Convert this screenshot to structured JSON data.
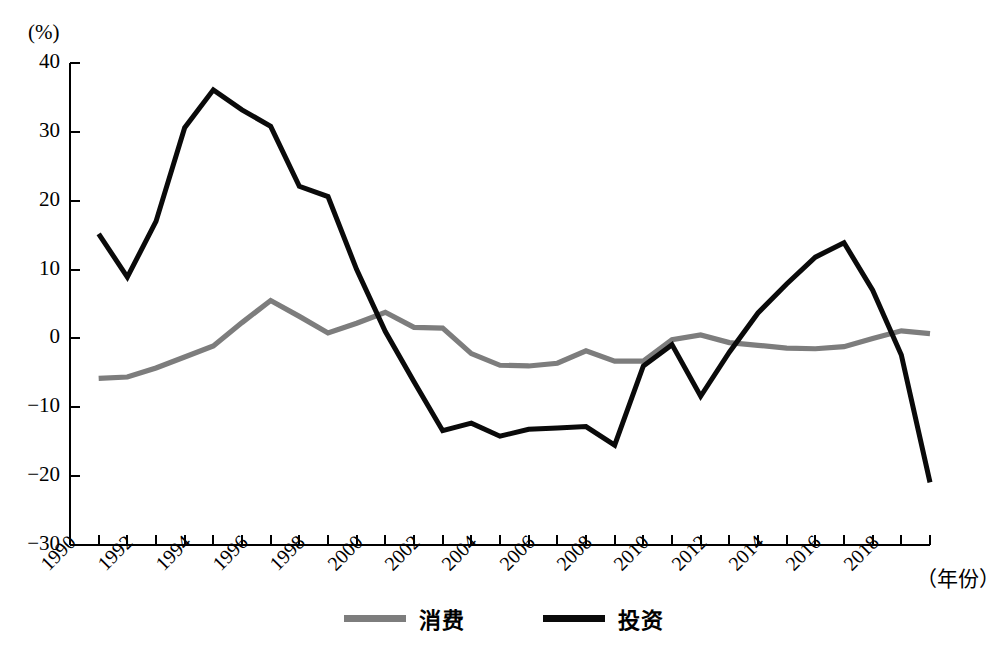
{
  "chart_data": {
    "type": "line",
    "title": "",
    "unit_label": "(%)",
    "xlabel": "（年份）",
    "ylabel": "",
    "x": [
      1991,
      1992,
      1993,
      1994,
      1995,
      1996,
      1997,
      1998,
      1999,
      2000,
      2001,
      2002,
      2003,
      2004,
      2005,
      2006,
      2007,
      2008,
      2009,
      2010,
      2011,
      2012,
      2013,
      2014,
      2015,
      2016,
      2017,
      2018,
      2019,
      2020
    ],
    "xlim": [
      1990,
      2020
    ],
    "ylim": [
      -30,
      40
    ],
    "yticks": [
      40,
      30,
      20,
      10,
      0,
      -10,
      -20,
      -30
    ],
    "ytick_labels": [
      "40",
      "30",
      "20",
      "10",
      "0",
      "−10",
      "−20",
      "−30"
    ],
    "xticks": [
      1990,
      1992,
      1994,
      1996,
      1998,
      2000,
      2002,
      2004,
      2006,
      2008,
      2010,
      2012,
      2014,
      2016,
      2018
    ],
    "xtick_labels": [
      "1990",
      "1992",
      "1994",
      "1996",
      "1998",
      "2000",
      "2002",
      "2004",
      "2006",
      "2008",
      "2010",
      "2012",
      "2014",
      "2016",
      "2018"
    ],
    "grid": false,
    "legend_position": "bottom",
    "series": [
      {
        "name": "消费",
        "color": "#7d7d7d",
        "values": [
          -5.8,
          -5.6,
          -4.3,
          -2.7,
          -1.1,
          2.3,
          5.5,
          3.2,
          0.8,
          2.2,
          3.8,
          1.6,
          1.5,
          -2.2,
          -3.9,
          -4.0,
          -3.6,
          -1.8,
          -3.3,
          -3.3,
          -0.2,
          0.5,
          -0.6,
          -1.0,
          -1.4,
          -1.5,
          -1.2,
          0.0,
          1.1,
          0.7
        ]
      },
      {
        "name": "投资",
        "color": "#0a0a0a",
        "values": [
          15.2,
          8.9,
          17.0,
          30.6,
          36.1,
          33.2,
          30.8,
          22.1,
          20.6,
          10.0,
          1.0,
          -6.3,
          -13.4,
          -12.3,
          -14.2,
          -13.2,
          -13.0,
          -12.8,
          -15.5,
          -4.0,
          -0.9,
          -8.4,
          -2.0,
          3.7,
          7.9,
          11.8,
          13.9,
          7.0,
          -2.4,
          -20.9
        ]
      }
    ]
  },
  "legend": {
    "items": [
      {
        "label": "消费",
        "color": "#7d7d7d",
        "name": "consumption"
      },
      {
        "label": "投资",
        "color": "#0a0a0a",
        "name": "investment"
      }
    ]
  }
}
